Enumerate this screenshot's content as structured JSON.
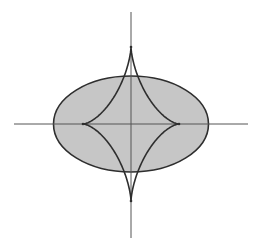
{
  "diagram": {
    "canvas": {
      "width": 260,
      "height": 252
    },
    "center": {
      "x": 131,
      "y": 124
    },
    "colors": {
      "background": "#ffffff",
      "ellipse_fill": "#c6c6c6",
      "stroke": "#2e2e2e",
      "axis": "#555555"
    },
    "axes": {
      "horizontal": {
        "x1": 14,
        "x2": 248,
        "y": 124
      },
      "vertical": {
        "x": 131,
        "y1": 12,
        "y2": 238
      }
    },
    "ellipse": {
      "rx": 77.5,
      "ry": 48
    },
    "evolute": {
      "cusps": [
        {
          "name": "left",
          "x": 83,
          "y": 124
        },
        {
          "name": "right",
          "x": 179,
          "y": 124
        },
        {
          "name": "top",
          "x": 131,
          "y": 47
        },
        {
          "name": "bottom",
          "x": 131,
          "y": 201
        }
      ]
    }
  }
}
